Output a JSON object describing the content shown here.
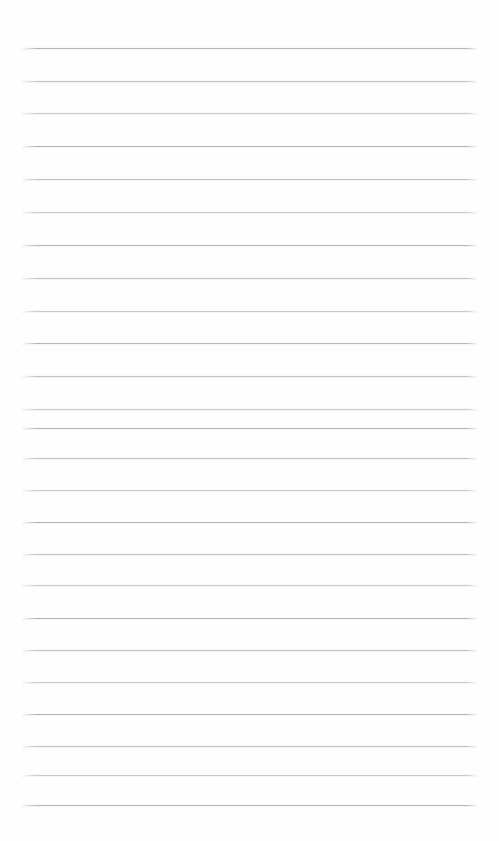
{
  "page": {
    "kind": "lined-paper-sheet",
    "width": 499,
    "height": 841,
    "background_color": "#fefefe",
    "content_text": ""
  },
  "ruling": {
    "line_color": "#b9b9b9",
    "line_thickness": 1,
    "line_count": 24,
    "left_margin": 22,
    "right_margin": 22,
    "line_width": 455,
    "first_line_y": 48,
    "line_spacing": 32.9,
    "lines": [
      {
        "index": 1,
        "y": 48,
        "x": 22,
        "width": 455
      },
      {
        "index": 2,
        "y": 81,
        "x": 22,
        "width": 455
      },
      {
        "index": 3,
        "y": 113,
        "x": 22,
        "width": 455
      },
      {
        "index": 4,
        "y": 146,
        "x": 22,
        "width": 455
      },
      {
        "index": 5,
        "y": 179,
        "x": 22,
        "width": 455
      },
      {
        "index": 6,
        "y": 212,
        "x": 22,
        "width": 455
      },
      {
        "index": 7,
        "y": 245,
        "x": 22,
        "width": 455
      },
      {
        "index": 8,
        "y": 278,
        "x": 22,
        "width": 455
      },
      {
        "index": 9,
        "y": 311,
        "x": 22,
        "width": 455
      },
      {
        "index": 10,
        "y": 343,
        "x": 22,
        "width": 455
      },
      {
        "index": 11,
        "y": 376,
        "x": 22,
        "width": 455
      },
      {
        "index": 12,
        "y": 409,
        "x": 22,
        "width": 455
      },
      {
        "index": 13,
        "y": 428,
        "x": 22,
        "width": 455
      },
      {
        "index": 14,
        "y": 458,
        "x": 22,
        "width": 455
      },
      {
        "index": 15,
        "y": 490,
        "x": 22,
        "width": 455
      },
      {
        "index": 16,
        "y": 522,
        "x": 22,
        "width": 455
      },
      {
        "index": 17,
        "y": 554,
        "x": 22,
        "width": 455
      },
      {
        "index": 18,
        "y": 585,
        "x": 22,
        "width": 455
      },
      {
        "index": 19,
        "y": 618,
        "x": 22,
        "width": 455
      },
      {
        "index": 20,
        "y": 650,
        "x": 22,
        "width": 455
      },
      {
        "index": 21,
        "y": 682,
        "x": 22,
        "width": 455
      },
      {
        "index": 22,
        "y": 714,
        "x": 22,
        "width": 455
      },
      {
        "index": 23,
        "y": 746,
        "x": 22,
        "width": 455
      },
      {
        "index": 24,
        "y": 775,
        "x": 22,
        "width": 455
      },
      {
        "index": 25,
        "y": 805,
        "x": 22,
        "width": 455
      }
    ]
  }
}
